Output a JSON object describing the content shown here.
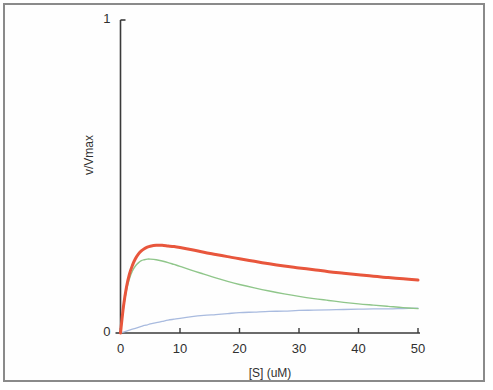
{
  "figure": {
    "background_color": "#ffffff",
    "frame_color": "#8a8a8a",
    "axis_color": "#3a3a3a"
  },
  "chart_data": {
    "type": "line",
    "title": "",
    "subtitle": "",
    "xlabel": "[S] (uM)",
    "ylabel": "v/Vmax",
    "xlim": [
      0,
      50
    ],
    "ylim": [
      0,
      1
    ],
    "xticks": [
      0,
      10,
      20,
      30,
      40,
      50
    ],
    "xtick_labels": [
      "0",
      "10",
      "20",
      "30",
      "40",
      "50"
    ],
    "yticks": [
      0,
      1
    ],
    "ytick_labels": [
      "0",
      "1"
    ],
    "grid": false,
    "legend": false,
    "legend_position": "none",
    "annotations": [],
    "series": [
      {
        "name": "red-curve",
        "color": "#e8563c",
        "line_width": 3.0,
        "x": [
          0,
          0.5,
          1,
          1.5,
          2,
          2.5,
          3,
          3.5,
          4,
          4.5,
          5,
          6,
          7,
          8,
          9,
          10,
          12,
          14,
          16,
          18,
          20,
          22.5,
          25,
          27.5,
          30,
          32.5,
          35,
          37.5,
          40,
          42.5,
          45,
          47.5,
          50
        ],
        "y": [
          0.0,
          0.085,
          0.146,
          0.188,
          0.216,
          0.237,
          0.252,
          0.262,
          0.269,
          0.274,
          0.277,
          0.28,
          0.28,
          0.278,
          0.276,
          0.273,
          0.266,
          0.258,
          0.251,
          0.244,
          0.237,
          0.229,
          0.221,
          0.214,
          0.208,
          0.202,
          0.196,
          0.191,
          0.186,
          0.181,
          0.177,
          0.173,
          0.169
        ]
      },
      {
        "name": "green-curve",
        "color": "#8fc68a",
        "line_width": 1.4,
        "x": [
          0,
          0.5,
          1,
          1.5,
          2,
          2.5,
          3,
          3.5,
          4,
          4.5,
          5,
          6,
          7,
          8,
          9,
          10,
          12,
          14,
          16,
          18,
          20,
          22.5,
          25,
          27.5,
          30,
          32.5,
          35,
          37.5,
          40,
          42.5,
          45,
          47.5,
          50
        ],
        "y": [
          0.0,
          0.08,
          0.136,
          0.173,
          0.198,
          0.214,
          0.224,
          0.231,
          0.234,
          0.236,
          0.236,
          0.234,
          0.23,
          0.225,
          0.219,
          0.213,
          0.2,
          0.188,
          0.176,
          0.165,
          0.155,
          0.144,
          0.134,
          0.125,
          0.117,
          0.11,
          0.104,
          0.098,
          0.093,
          0.089,
          0.085,
          0.081,
          0.078
        ]
      },
      {
        "name": "blue-curve",
        "color": "#a9bbdf",
        "line_width": 1.3,
        "x": [
          0,
          0.5,
          1,
          1.5,
          2,
          2.5,
          3,
          3.5,
          4,
          4.5,
          5,
          6,
          7,
          8,
          9,
          10,
          12,
          14,
          16,
          18,
          20,
          22.5,
          25,
          27.5,
          30,
          32.5,
          35,
          37.5,
          40,
          42.5,
          45,
          47.5,
          50
        ],
        "y": [
          0.0,
          0.003,
          0.006,
          0.009,
          0.012,
          0.015,
          0.018,
          0.021,
          0.024,
          0.026,
          0.029,
          0.033,
          0.037,
          0.041,
          0.044,
          0.047,
          0.052,
          0.056,
          0.059,
          0.062,
          0.065,
          0.067,
          0.069,
          0.07,
          0.072,
          0.073,
          0.074,
          0.075,
          0.076,
          0.077,
          0.077,
          0.078,
          0.079
        ]
      }
    ]
  }
}
